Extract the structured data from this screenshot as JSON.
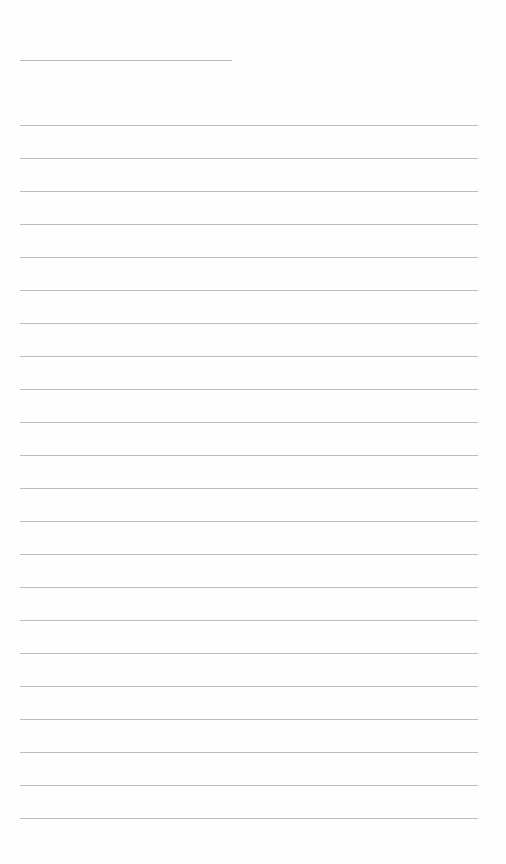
{
  "document": {
    "type": "blank lined sheet",
    "header_line_count": 1,
    "ruled_line_count": 22,
    "colors": {
      "background": "#fefefe",
      "line": "#bdbdbd"
    }
  }
}
